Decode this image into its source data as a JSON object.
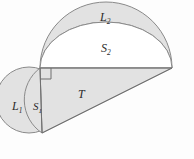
{
  "figure": {
    "kind": "geometry-diagram",
    "caption": "",
    "colors": {
      "fill_shaded": "#e2e2e2",
      "fill_white": "#ffffff",
      "stroke": "#8a8a8a",
      "stroke_dark": "#6f6f6f",
      "label_text": "#2b2b2b",
      "background": "#ffffff"
    },
    "labels": {
      "lune_small": "L",
      "lune_small_sub": "1",
      "segment_small": "S",
      "segment_small_sub": "1",
      "lune_large": "L",
      "lune_large_sub": "2",
      "segment_large": "S",
      "segment_large_sub": "2",
      "triangle": "T"
    },
    "regions": [
      {
        "name": "L1",
        "role": "small lune",
        "shaded": true
      },
      {
        "name": "S1",
        "role": "small circular segment",
        "shaded": true
      },
      {
        "name": "L2",
        "role": "large lune",
        "shaded": true
      },
      {
        "name": "S2",
        "role": "large circular segment",
        "shaded": false
      },
      {
        "name": "T",
        "role": "right triangle",
        "shaded": true
      }
    ],
    "geometry": {
      "right_angle_vertex": [
        40,
        68
      ],
      "bottom_vertex": [
        42,
        133
      ],
      "right_vertex": [
        172,
        68
      ],
      "right_angle_marker": true
    }
  }
}
